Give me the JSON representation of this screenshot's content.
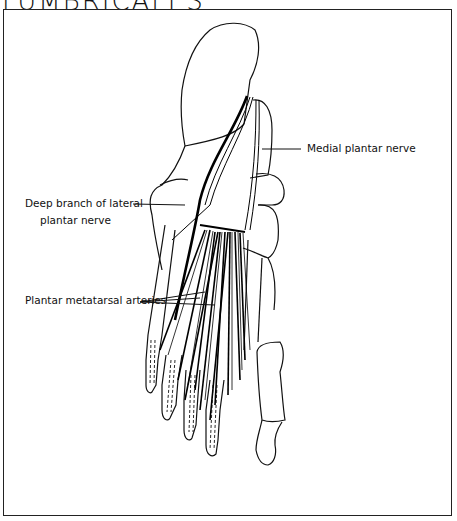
{
  "figure": {
    "title": "LUMBRICALES",
    "labels": {
      "medial_plantar_nerve": "Medial plantar nerve",
      "deep_branch_line1": "Deep branch of lateral",
      "deep_branch_line2": "plantar nerve",
      "plantar_metatarsal_arteries": "Plantar metatarsal arteries"
    }
  }
}
